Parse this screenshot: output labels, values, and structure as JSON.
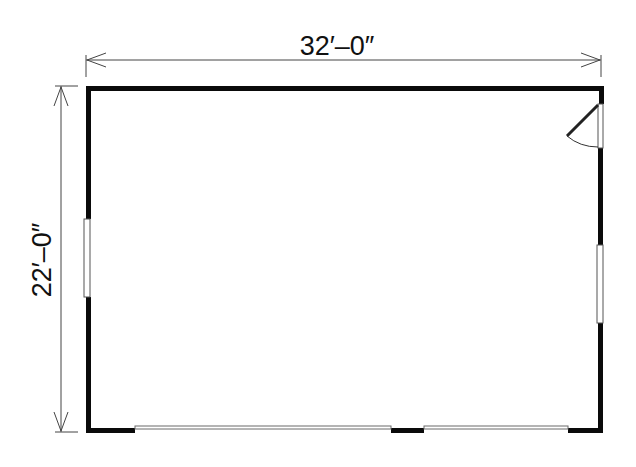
{
  "plan": {
    "width_dimension": "32′–0″",
    "depth_dimension": "22′–0″",
    "colors": {
      "wall": "#0a0a0a",
      "dimension_line": "#444444",
      "opening_line": "#6a6a6a",
      "background": "#ffffff"
    },
    "elements": {
      "walls": "exterior walls (rectangle)",
      "door": "swing door on right wall",
      "windows": [
        "left wall window",
        "right wall window"
      ],
      "garage_doors": [
        "bottom-left garage door opening",
        "bottom-right garage door opening"
      ]
    }
  }
}
